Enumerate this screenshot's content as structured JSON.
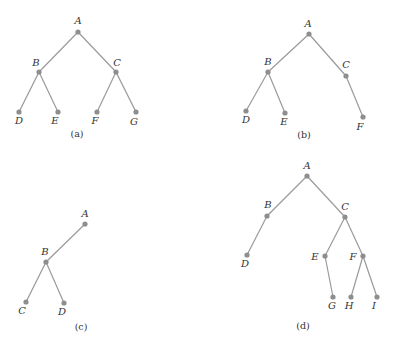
{
  "colors": {
    "edge": "#9a9a9a",
    "node": "#8e8e8e",
    "text": "#333333",
    "background": "#ffffff"
  },
  "trees": [
    {
      "id": "a",
      "caption": "(a)",
      "caption_pos": [
        77,
        137
      ],
      "nodes": [
        {
          "label": "A",
          "x": 78,
          "y": 32,
          "lx": 78,
          "ly": 24,
          "anchor": "middle"
        },
        {
          "label": "B",
          "x": 39,
          "y": 72,
          "lx": 36,
          "ly": 66,
          "anchor": "end",
          "ldx": 0
        },
        {
          "label": "C",
          "x": 116,
          "y": 72,
          "lx": 117,
          "ly": 66,
          "anchor": "middle"
        },
        {
          "label": "D",
          "x": 19,
          "y": 112,
          "lx": 19,
          "ly": 124,
          "anchor": "middle"
        },
        {
          "label": "E",
          "x": 58,
          "y": 112,
          "lx": 55,
          "ly": 124,
          "anchor": "middle"
        },
        {
          "label": "F",
          "x": 97,
          "y": 112,
          "lx": 95,
          "ly": 124,
          "anchor": "middle"
        },
        {
          "label": "G",
          "x": 136,
          "y": 112,
          "lx": 134,
          "ly": 125,
          "anchor": "middle"
        }
      ],
      "edges": [
        [
          "A",
          "B"
        ],
        [
          "A",
          "C"
        ],
        [
          "B",
          "D"
        ],
        [
          "B",
          "E"
        ],
        [
          "C",
          "F"
        ],
        [
          "C",
          "G"
        ]
      ]
    },
    {
      "id": "b",
      "caption": "(b)",
      "caption_pos": [
        304,
        138
      ],
      "nodes": [
        {
          "label": "A",
          "x": 309,
          "y": 34,
          "lx": 308,
          "ly": 27,
          "anchor": "middle"
        },
        {
          "label": "B",
          "x": 268,
          "y": 72,
          "lx": 268,
          "ly": 65,
          "anchor": "middle"
        },
        {
          "label": "C",
          "x": 346,
          "y": 76,
          "lx": 346,
          "ly": 68,
          "anchor": "middle"
        },
        {
          "label": "D",
          "x": 246,
          "y": 111,
          "lx": 246,
          "ly": 123,
          "anchor": "middle"
        },
        {
          "label": "E",
          "x": 285,
          "y": 113,
          "lx": 284,
          "ly": 125,
          "anchor": "middle"
        },
        {
          "label": "F",
          "x": 363,
          "y": 117,
          "lx": 360,
          "ly": 130,
          "anchor": "middle"
        }
      ],
      "edges": [
        [
          "A",
          "B"
        ],
        [
          "A",
          "C"
        ],
        [
          "B",
          "D"
        ],
        [
          "B",
          "E"
        ],
        [
          "C",
          "F"
        ]
      ]
    },
    {
      "id": "c",
      "caption": "(c)",
      "caption_pos": [
        81,
        330
      ],
      "nodes": [
        {
          "label": "A",
          "x": 85,
          "y": 224,
          "lx": 85,
          "ly": 217,
          "anchor": "middle"
        },
        {
          "label": "B",
          "x": 46,
          "y": 262,
          "lx": 45,
          "ly": 255,
          "anchor": "middle"
        },
        {
          "label": "C",
          "x": 26,
          "y": 302,
          "lx": 22,
          "ly": 314,
          "anchor": "middle"
        },
        {
          "label": "D",
          "x": 64,
          "y": 303,
          "lx": 62,
          "ly": 315,
          "anchor": "middle"
        }
      ],
      "edges": [
        [
          "A",
          "B"
        ],
        [
          "B",
          "C"
        ],
        [
          "B",
          "D"
        ]
      ]
    },
    {
      "id": "d",
      "caption": "(d)",
      "caption_pos": [
        303,
        329
      ],
      "nodes": [
        {
          "label": "A",
          "x": 307,
          "y": 176,
          "lx": 307,
          "ly": 169,
          "anchor": "middle"
        },
        {
          "label": "B",
          "x": 267,
          "y": 216,
          "lx": 268,
          "ly": 208,
          "anchor": "middle"
        },
        {
          "label": "C",
          "x": 345,
          "y": 217,
          "lx": 345,
          "ly": 210,
          "anchor": "middle"
        },
        {
          "label": "D",
          "x": 247,
          "y": 255,
          "lx": 245,
          "ly": 267,
          "anchor": "middle"
        },
        {
          "label": "E",
          "x": 325,
          "y": 256,
          "lx": 315,
          "ly": 260,
          "anchor": "middle"
        },
        {
          "label": "F",
          "x": 363,
          "y": 256,
          "lx": 353,
          "ly": 260,
          "anchor": "middle"
        },
        {
          "label": "G",
          "x": 333,
          "y": 297,
          "lx": 332,
          "ly": 309,
          "anchor": "middle"
        },
        {
          "label": "H",
          "x": 351,
          "y": 297,
          "lx": 349,
          "ly": 309,
          "anchor": "middle"
        },
        {
          "label": "I",
          "x": 377,
          "y": 297,
          "lx": 374,
          "ly": 309,
          "anchor": "middle"
        }
      ],
      "edges": [
        [
          "A",
          "B"
        ],
        [
          "A",
          "C"
        ],
        [
          "B",
          "D"
        ],
        [
          "C",
          "E"
        ],
        [
          "C",
          "F"
        ],
        [
          "E",
          "G"
        ],
        [
          "F",
          "H"
        ],
        [
          "F",
          "I"
        ]
      ]
    }
  ]
}
